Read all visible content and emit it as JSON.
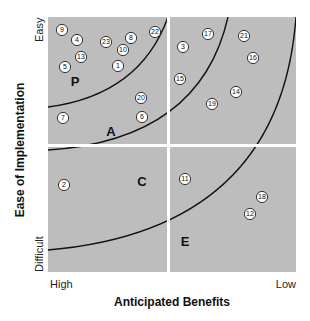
{
  "chart_data": {
    "type": "scatter",
    "title": "",
    "xlabel": "Anticipated Benefits",
    "ylabel": "Ease of Implementation",
    "x_ticks": [
      "High",
      "Low"
    ],
    "y_ticks": [
      "Easy",
      "Difficult"
    ],
    "grid": false,
    "legend": null,
    "quadrant_dividers": {
      "vertical_x_fraction": 0.48,
      "horizontal_y_fraction": 0.5
    },
    "zones": [
      {
        "label": "P",
        "x": 75,
        "y": 86
      },
      {
        "label": "A",
        "x": 111,
        "y": 136
      },
      {
        "label": "C",
        "x": 142,
        "y": 186
      },
      {
        "label": "E",
        "x": 185,
        "y": 246
      }
    ],
    "curves": [
      {
        "name": "P-A boundary",
        "path": "M48,107 Q140,95 168,17"
      },
      {
        "name": "A-C boundary",
        "path": "M48,150 Q200,140 228,17"
      },
      {
        "name": "C-E boundary",
        "path": "M48,250 Q280,230 296,17"
      }
    ],
    "points": [
      {
        "id": "1",
        "x": 118,
        "y": 66
      },
      {
        "id": "2",
        "x": 64,
        "y": 185
      },
      {
        "id": "3",
        "x": 183,
        "y": 47
      },
      {
        "id": "4",
        "x": 77,
        "y": 40
      },
      {
        "id": "5",
        "x": 65,
        "y": 67
      },
      {
        "id": "6",
        "x": 142,
        "y": 117
      },
      {
        "id": "7",
        "x": 63,
        "y": 118
      },
      {
        "id": "8",
        "x": 131,
        "y": 38
      },
      {
        "id": "9",
        "x": 62,
        "y": 30
      },
      {
        "id": "10",
        "x": 123,
        "y": 50
      },
      {
        "id": "11",
        "x": 185,
        "y": 179
      },
      {
        "id": "12",
        "x": 250,
        "y": 214
      },
      {
        "id": "13",
        "x": 81,
        "y": 57
      },
      {
        "id": "14",
        "x": 236,
        "y": 92
      },
      {
        "id": "15",
        "x": 180,
        "y": 79
      },
      {
        "id": "16",
        "x": 253,
        "y": 58
      },
      {
        "id": "17",
        "x": 208,
        "y": 34
      },
      {
        "id": "18",
        "x": 262,
        "y": 197
      },
      {
        "id": "19",
        "x": 212,
        "y": 104
      },
      {
        "id": "20",
        "x": 141,
        "y": 98
      },
      {
        "id": "21",
        "x": 244,
        "y": 36
      },
      {
        "id": "22",
        "x": 155,
        "y": 32
      },
      {
        "id": "23",
        "x": 106,
        "y": 42
      }
    ]
  },
  "colors": {
    "plot_background": "#bdbdbd",
    "divider": "#ffffff",
    "curve": "#111111",
    "point_fill": "#ffffff",
    "point_stroke": "#222222"
  }
}
